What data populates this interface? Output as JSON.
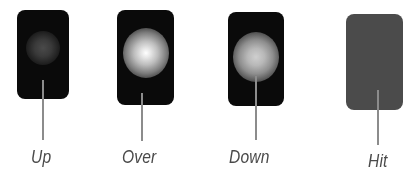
{
  "diagram": {
    "type": "button-states",
    "states": [
      {
        "id": "up",
        "label": "Up",
        "fill": "#0a0a0a",
        "glow": "dim"
      },
      {
        "id": "over",
        "label": "Over",
        "fill": "#0a0a0a",
        "glow": "bright"
      },
      {
        "id": "down",
        "label": "Down",
        "fill": "#0a0a0a",
        "glow": "medium"
      },
      {
        "id": "hit",
        "label": "Hit",
        "fill": "#4b4b4b",
        "glow": "none"
      }
    ],
    "colors": {
      "leader_line": "#8c8c8c",
      "label_text": "#4a4a4a",
      "background": "#ffffff"
    }
  }
}
